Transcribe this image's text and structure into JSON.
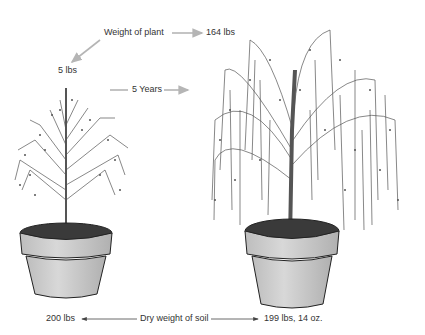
{
  "labels": {
    "weight_of_plant": "Weight of plant",
    "initial_plant_weight": "5 lbs",
    "final_plant_weight": "164 lbs",
    "duration": "5 Years",
    "dry_weight_of_soil": "Dry weight of soil",
    "initial_soil_weight": "200 lbs",
    "final_soil_weight": "199 lbs, 14 oz."
  },
  "colors": {
    "arrow_gray": "#b5b5b5",
    "arrow_dark": "#444444",
    "pot_fill": "#cfcfcf",
    "pot_shade": "#b8b8b8",
    "soil": "#3a3a3a",
    "tree": "#555555"
  }
}
